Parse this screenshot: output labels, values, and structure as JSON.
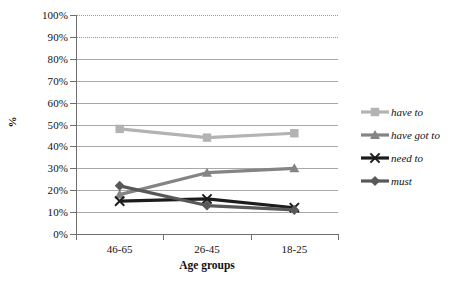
{
  "chart_data": {
    "type": "line",
    "title": "",
    "xlabel": "Age groups",
    "ylabel": "%",
    "categories": [
      "46-65",
      "26-45",
      "18-25"
    ],
    "ylim": [
      0,
      100
    ],
    "grid": true,
    "legend_position": "right",
    "y_ticks": [
      "0%",
      "10%",
      "20%",
      "30%",
      "40%",
      "50%",
      "60%",
      "70%",
      "80%",
      "90%",
      "100%"
    ],
    "y_tick_values": [
      0,
      10,
      20,
      30,
      40,
      50,
      60,
      70,
      80,
      90,
      100
    ],
    "series": [
      {
        "name": "have to",
        "values": [
          48,
          44,
          46
        ],
        "color": "#b3b3b3",
        "marker": "square"
      },
      {
        "name": "have got to",
        "values": [
          18,
          28,
          30
        ],
        "color": "#848484",
        "marker": "triangle"
      },
      {
        "name": "need to",
        "values": [
          15,
          16,
          12
        ],
        "color": "#1c1c1c",
        "marker": "x"
      },
      {
        "name": "must",
        "values": [
          22,
          13,
          11
        ],
        "color": "#585858",
        "marker": "diamond"
      }
    ]
  },
  "legend": {
    "items": [
      {
        "label": "have to"
      },
      {
        "label": "have got to"
      },
      {
        "label": "need to"
      },
      {
        "label": "must"
      }
    ]
  },
  "axes": {
    "y_title": "%",
    "x_title": "Age groups"
  }
}
